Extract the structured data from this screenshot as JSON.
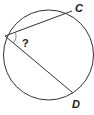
{
  "diagram": {
    "type": "inscribed-angle",
    "circle": {
      "cx": 48.5,
      "cy": 55,
      "r": 45,
      "stroke": "#333333"
    },
    "vertex": {
      "x": 5,
      "y": 36
    },
    "points": {
      "C": {
        "x": 72,
        "y": 11,
        "label": "C",
        "label_x": 75,
        "label_y": 12
      },
      "D": {
        "x": 73,
        "y": 93,
        "label": "D",
        "label_x": 72,
        "label_y": 108
      }
    },
    "angle_label": {
      "text": "?",
      "x": 22,
      "y": 47
    },
    "line_color": "#333333"
  }
}
